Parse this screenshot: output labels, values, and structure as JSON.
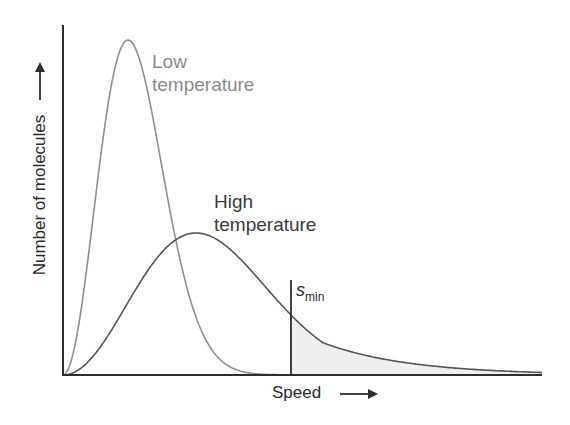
{
  "chart_data": {
    "type": "line",
    "title": "",
    "xlabel": "Speed",
    "ylabel": "Number of molecules",
    "grid": false,
    "legend": "inline labels",
    "series": [
      {
        "name": "Low temperature",
        "color": "#8f8f8f",
        "peak_x_fraction": 0.135,
        "peak_y_fraction": 1.0
      },
      {
        "name": "High temperature",
        "color": "#555555",
        "peak_x_fraction": 0.28,
        "peak_y_fraction": 0.42
      }
    ],
    "annotations": [
      {
        "label": "s_min",
        "x_fraction": 0.475,
        "note": "threshold speed; area to the right shaded (light = high T, dark = low T)"
      }
    ]
  },
  "labels": {
    "low_line1": "Low",
    "low_line2": "temperature",
    "high_line1": "High",
    "high_line2": "temperature",
    "ylabel": "Number of molecules",
    "xlabel": "Speed",
    "smin_s": "s",
    "smin_sub": "min",
    "arrow": "⟶"
  },
  "colors": {
    "axis": "#2e2e2e",
    "low_curve": "#8f8f8f",
    "high_curve": "#555555",
    "shade_high": "#efefef",
    "shade_low": "#8c8c8c"
  }
}
